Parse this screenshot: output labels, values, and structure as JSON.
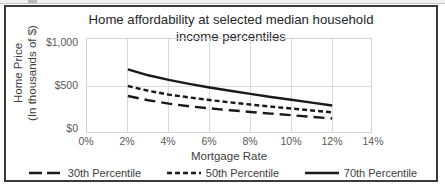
{
  "chart_data": {
    "type": "line",
    "title": "Home affordability at selected median household income percentiles",
    "title_line1": "Home affordability at selected median household",
    "title_line2": "income percentiles",
    "xlabel": "Mortgage Rate",
    "ylabel": "Home Price",
    "ylabel_line1": "Home Price",
    "ylabel_line2": "(In thousands of $)",
    "x": [
      2,
      3,
      4,
      5,
      6,
      7,
      8,
      9,
      10,
      11,
      12
    ],
    "xtick_labels": [
      "0%",
      "2%",
      "4%",
      "6%",
      "8%",
      "10%",
      "12%",
      "14%"
    ],
    "xtick_values": [
      0,
      2,
      4,
      6,
      8,
      10,
      12,
      14
    ],
    "ytick_labels": [
      "$0",
      "$500",
      "$1,000"
    ],
    "ytick_values": [
      0,
      500,
      1000
    ],
    "xlim": [
      0,
      14
    ],
    "ylim": [
      0,
      1000
    ],
    "grid": true,
    "legend_position": "bottom",
    "series": [
      {
        "name": "30th Percentile",
        "style": "long-dash",
        "color": "#1a1a1a",
        "values": [
          400,
          355,
          320,
          292,
          270,
          250,
          232,
          215,
          198,
          180,
          163
        ]
      },
      {
        "name": "50th Percentile",
        "style": "short-dash",
        "color": "#1a1a1a",
        "values": [
          505,
          455,
          415,
          385,
          358,
          333,
          310,
          288,
          268,
          248,
          228
        ]
      },
      {
        "name": "70th Percentile",
        "style": "solid",
        "color": "#1a1a1a",
        "values": [
          680,
          618,
          570,
          528,
          490,
          455,
          422,
          390,
          360,
          330,
          300
        ]
      }
    ]
  },
  "legend": {
    "items": [
      {
        "label": "30th Percentile",
        "swatch": "long-dash-swatch"
      },
      {
        "label": "50th Percentile",
        "swatch": "short-dash-swatch"
      },
      {
        "label": "70th Percentile",
        "swatch": "solid-line-swatch"
      }
    ]
  },
  "colors": {
    "series_line": "#1a1a1a",
    "gridline": "#d9d9d9",
    "plot_border": "#d2d2d2",
    "frame_border": "#3a3a3a",
    "tick_text": "#595959",
    "axis_title_text": "#404040",
    "title_text": "#262626",
    "background": "#ffffff"
  }
}
